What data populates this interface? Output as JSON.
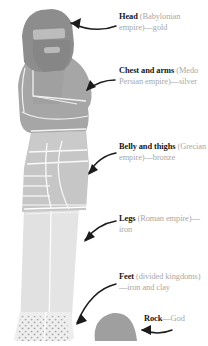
{
  "diagram": {
    "background_color": "#ffffff",
    "heading_color": "#171717",
    "body_text_color": "#a8a8a8",
    "arrow_color": "#1a1a1a"
  },
  "labels": [
    {
      "id": "head",
      "heading": "Head",
      "detail": " (Babylonian empire)—gold",
      "material": "gold",
      "empire": "Babylonian empire"
    },
    {
      "id": "chest",
      "heading": "Chest and arms",
      "detail": " (Medo Persian empire)—silver",
      "material": "silver",
      "empire": "Medo Persian empire"
    },
    {
      "id": "belly",
      "heading": "Belly and thighs",
      "detail": " (Grecian empire)—bronze",
      "material": "bronze",
      "empire": "Grecian empire"
    },
    {
      "id": "legs",
      "heading": "Legs",
      "detail": " (Roman empire)—iron",
      "material": "iron",
      "empire": "Roman empire"
    },
    {
      "id": "feet",
      "heading": "Feet",
      "detail": " (divided kingdoms)—iron and clay",
      "material": "iron and clay",
      "empire": "divided kingdoms"
    },
    {
      "id": "rock",
      "heading": "Rock",
      "detail": "—God",
      "material": "God",
      "empire": ""
    }
  ],
  "statue": {
    "parts": [
      {
        "name": "head",
        "color": "#8f8f8f",
        "tone": "dark gray"
      },
      {
        "name": "face-band",
        "color": "#bdbdbd",
        "tone": "light gray"
      },
      {
        "name": "chest-and-arms",
        "color": "#a5a5a5",
        "tone": "medium gray"
      },
      {
        "name": "belly-and-thighs",
        "color": "#c4c4c4",
        "tone": "light gray"
      },
      {
        "name": "legs",
        "color": "#e2e2e2",
        "tone": "very light gray"
      },
      {
        "name": "feet",
        "color": "#ededed",
        "tone": "speckled light gray"
      },
      {
        "name": "rock",
        "color": "#9e9e9e",
        "tone": "medium gray"
      }
    ]
  }
}
